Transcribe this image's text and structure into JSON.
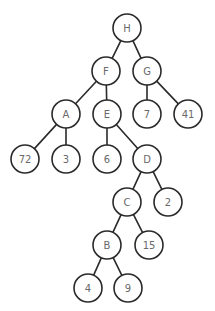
{
  "diagram": {
    "type": "binary-tree",
    "node_radius": 14,
    "colors": {
      "stroke": "#2a2a2a",
      "label": "#6a6a6a",
      "fill": "#ffffff",
      "background": "#ffffff"
    },
    "nodes": [
      {
        "id": "H",
        "label": "H",
        "x": 127,
        "y": 28
      },
      {
        "id": "F",
        "label": "F",
        "x": 106,
        "y": 71
      },
      {
        "id": "G",
        "label": "G",
        "x": 147,
        "y": 71
      },
      {
        "id": "A",
        "label": "A",
        "x": 66,
        "y": 114
      },
      {
        "id": "E",
        "label": "E",
        "x": 107,
        "y": 114
      },
      {
        "id": "n7",
        "label": "7",
        "x": 147,
        "y": 114
      },
      {
        "id": "n41",
        "label": "41",
        "x": 188,
        "y": 114
      },
      {
        "id": "n72",
        "label": "72",
        "x": 25,
        "y": 159
      },
      {
        "id": "n3",
        "label": "3",
        "x": 66,
        "y": 159
      },
      {
        "id": "n6",
        "label": "6",
        "x": 107,
        "y": 159
      },
      {
        "id": "D",
        "label": "D",
        "x": 147,
        "y": 159
      },
      {
        "id": "C",
        "label": "C",
        "x": 127,
        "y": 202
      },
      {
        "id": "n2",
        "label": "2",
        "x": 168,
        "y": 202
      },
      {
        "id": "B",
        "label": "B",
        "x": 107,
        "y": 245
      },
      {
        "id": "n15",
        "label": "15",
        "x": 149,
        "y": 245
      },
      {
        "id": "n4",
        "label": "4",
        "x": 88,
        "y": 288
      },
      {
        "id": "n9",
        "label": "9",
        "x": 128,
        "y": 288
      }
    ],
    "edges": [
      {
        "from": "H",
        "to": "F"
      },
      {
        "from": "H",
        "to": "G"
      },
      {
        "from": "F",
        "to": "A"
      },
      {
        "from": "F",
        "to": "E"
      },
      {
        "from": "G",
        "to": "n7"
      },
      {
        "from": "G",
        "to": "n41"
      },
      {
        "from": "A",
        "to": "n72"
      },
      {
        "from": "A",
        "to": "n3"
      },
      {
        "from": "E",
        "to": "n6"
      },
      {
        "from": "E",
        "to": "D"
      },
      {
        "from": "D",
        "to": "C"
      },
      {
        "from": "D",
        "to": "n2"
      },
      {
        "from": "C",
        "to": "B"
      },
      {
        "from": "C",
        "to": "n15"
      },
      {
        "from": "B",
        "to": "n4"
      },
      {
        "from": "B",
        "to": "n9"
      }
    ]
  }
}
